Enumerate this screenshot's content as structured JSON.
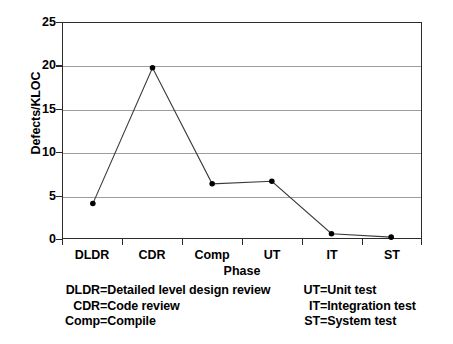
{
  "chart_data": {
    "type": "line",
    "title": "",
    "xlabel": "Phase",
    "ylabel": "Defects/KLOC",
    "categories": [
      "DLDR",
      "CDR",
      "Comp",
      "UT",
      "IT",
      "ST"
    ],
    "values": [
      4.0,
      19.8,
      6.3,
      6.6,
      0.5,
      0.1
    ],
    "series": [
      {
        "name": "Defects/KLOC",
        "values": [
          4.0,
          19.8,
          6.3,
          6.6,
          0.5,
          0.1
        ]
      }
    ],
    "ylim": [
      0,
      25
    ],
    "yticks": [
      0,
      5,
      10,
      15,
      20,
      25
    ],
    "ytick_labels": [
      "0",
      "5",
      "10",
      "15",
      "20",
      "25"
    ],
    "grid": "horizontal",
    "legend": "none",
    "marker": "filled-circle",
    "line_color": "#3a3a3a",
    "marker_color": "#000000",
    "grid_color": "#9d9d9d",
    "axis_color": "#2b2b2b"
  },
  "axes": {
    "y_title": "Defects/KLOC",
    "x_title": "Phase",
    "y_ticks": [
      "25",
      "20",
      "15",
      "10",
      "5",
      "0"
    ],
    "x_ticks": [
      "DLDR",
      "CDR",
      "Comp",
      "UT",
      "IT",
      "ST"
    ]
  },
  "abbreviations": {
    "left_column": [
      {
        "abbr": "DLDR",
        "eq": "=",
        "desc": "Detailed level design review"
      },
      {
        "abbr": "CDR",
        "eq": "=",
        "desc": "Code review"
      },
      {
        "abbr": "Comp",
        "eq": "=",
        "desc": "Compile"
      }
    ],
    "right_column": [
      {
        "abbr": "UT",
        "eq": "=",
        "desc": "Unit test"
      },
      {
        "abbr": "IT",
        "eq": "=",
        "desc": "Integration test"
      },
      {
        "abbr": "ST",
        "eq": "=",
        "desc": "System test"
      }
    ]
  }
}
